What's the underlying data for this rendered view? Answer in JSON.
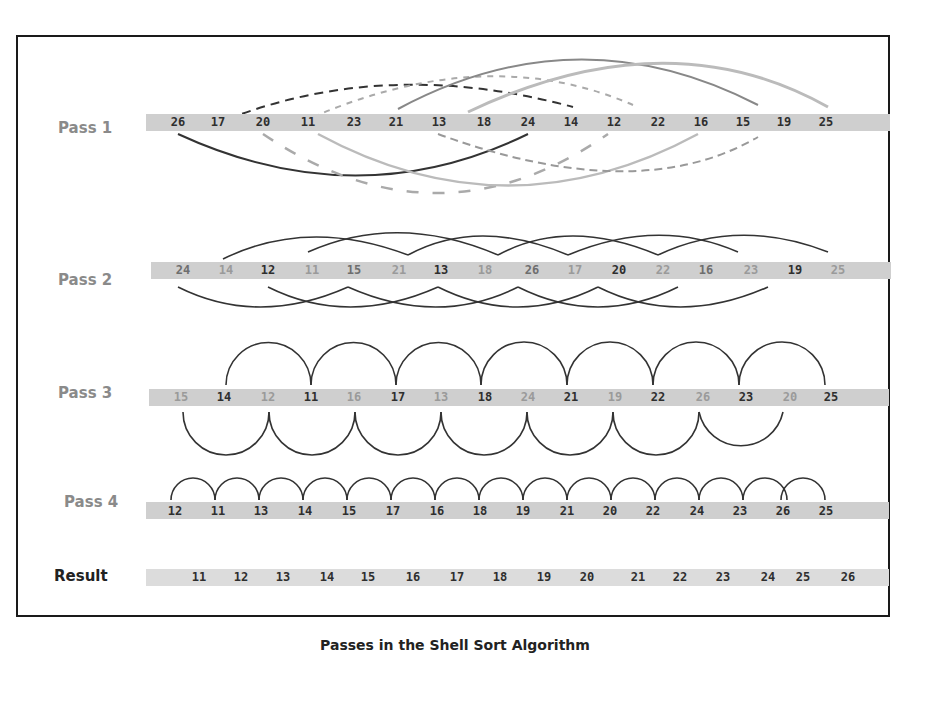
{
  "title": "Passes in the Shell Sort Algorithm",
  "rows": [
    {
      "label": "Pass 1",
      "values": [
        26,
        17,
        20,
        11,
        23,
        21,
        13,
        18,
        24,
        14,
        12,
        22,
        16,
        15,
        19,
        25
      ],
      "shades": [
        "d",
        "d",
        "d",
        "d",
        "d",
        "d",
        "d",
        "d",
        "d",
        "d",
        "d",
        "d",
        "d",
        "d",
        "d",
        "d"
      ]
    },
    {
      "label": "Pass 2",
      "values": [
        24,
        14,
        12,
        11,
        15,
        21,
        13,
        18,
        26,
        17,
        20,
        22,
        16,
        23,
        19,
        25
      ],
      "shades": [
        "m",
        "l",
        "d",
        "l",
        "m",
        "l",
        "d",
        "l",
        "m",
        "l",
        "d",
        "l",
        "m",
        "l",
        "d",
        "l"
      ]
    },
    {
      "label": "Pass 3",
      "values": [
        15,
        14,
        12,
        11,
        16,
        17,
        13,
        18,
        24,
        21,
        19,
        22,
        26,
        23,
        20,
        25
      ],
      "shades": [
        "l",
        "d",
        "l",
        "d",
        "l",
        "d",
        "l",
        "d",
        "l",
        "d",
        "l",
        "d",
        "l",
        "d",
        "l",
        "d"
      ]
    },
    {
      "label": "Pass 4",
      "values": [
        12,
        11,
        13,
        14,
        15,
        17,
        16,
        18,
        19,
        21,
        20,
        22,
        24,
        23,
        26,
        25
      ],
      "shades": [
        "d",
        "d",
        "d",
        "d",
        "d",
        "d",
        "d",
        "d",
        "d",
        "d",
        "d",
        "d",
        "d",
        "d",
        "d",
        "d"
      ]
    },
    {
      "label": "Result",
      "values": [
        11,
        12,
        13,
        14,
        15,
        16,
        17,
        18,
        19,
        20,
        21,
        22,
        23,
        24,
        25,
        26
      ],
      "shades": [
        "d",
        "d",
        "d",
        "d",
        "d",
        "d",
        "d",
        "d",
        "d",
        "d",
        "d",
        "d",
        "d",
        "d",
        "d",
        "d"
      ]
    }
  ],
  "colors": {
    "dark": "#2e2e2e",
    "medium": "#6e6e6e",
    "light": "#9a9a9a",
    "strip": "#cfcfcf",
    "label": "#8a8a8a"
  }
}
